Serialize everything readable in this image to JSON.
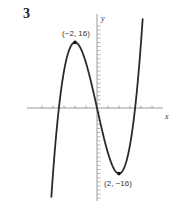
{
  "problem_number": "3",
  "chart_data": {
    "type": "line",
    "title": "",
    "function": "y = x^3 - 12x",
    "xlabel": "x",
    "ylabel": "y",
    "xlim": [
      -4.3,
      4.3
    ],
    "ylim": [
      -22,
      22
    ],
    "x_ticks": [
      -5,
      -4,
      -3,
      -2,
      -1,
      1,
      2,
      3,
      4,
      5
    ],
    "y_tick_step": 1,
    "grid": false,
    "series": [
      {
        "name": "curve",
        "x": [
          -4.3,
          -4,
          -3.5,
          -3,
          -2.5,
          -2,
          -1.5,
          -1,
          -0.5,
          0,
          0.5,
          1,
          1.5,
          2,
          2.5,
          3,
          3.5,
          4,
          4.3
        ],
        "y": [
          -28.1,
          -16,
          -0.875,
          9,
          14.375,
          16,
          14.625,
          11,
          5.875,
          0,
          -5.875,
          -11,
          -14.625,
          -16,
          -14.375,
          -9,
          0.875,
          16,
          28.1
        ]
      }
    ],
    "annotations": [
      {
        "label": "(−2, 16)",
        "x": -2,
        "y": 16,
        "type": "local-max"
      },
      {
        "label": "(2, −16)",
        "x": 2,
        "y": -16,
        "type": "local-min"
      }
    ],
    "colors": {
      "curve": "#2a2a2a",
      "axis": "#9a9a9a",
      "text": "#333333"
    }
  }
}
